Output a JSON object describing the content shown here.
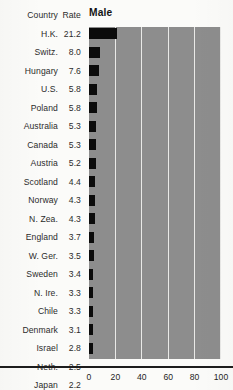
{
  "figure": {
    "title": "Male",
    "background_color": "#fbfbf9",
    "panel_color": "#8d8d8d",
    "bar_color": "#0b0b0b",
    "gridline_color": "#e9e9e7"
  },
  "table": {
    "header": {
      "country": "Country",
      "rate": "Rate",
      "series": "Male"
    }
  },
  "chart_data": {
    "type": "bar",
    "orientation": "horizontal",
    "title": "Male",
    "xlabel": "",
    "ylabel": "",
    "xlim": [
      0,
      100
    ],
    "grid": true,
    "grid_axis": "x",
    "legend": "none",
    "value_label_column_header": "Rate",
    "category_column_header": "Country",
    "xticks": [
      0,
      20,
      40,
      60,
      80,
      100
    ],
    "xticklabels": [
      "0",
      "20",
      "40",
      "60",
      "80",
      "100"
    ],
    "categories": [
      "H.K.",
      "Switz.",
      "Hungary",
      "U.S.",
      "Poland",
      "Australia",
      "Canada",
      "Austria",
      "Scotland",
      "Norway",
      "N. Zea.",
      "England",
      "W. Ger.",
      "Sweden",
      "N. Ire.",
      "Chile",
      "Denmark",
      "Israel",
      "Neth.",
      "Japan"
    ],
    "values": [
      21.2,
      8.0,
      7.6,
      5.8,
      5.8,
      5.3,
      5.3,
      5.2,
      4.4,
      4.3,
      4.3,
      3.7,
      3.5,
      3.4,
      3.3,
      3.3,
      3.1,
      2.8,
      2.5,
      2.2
    ],
    "value_labels": [
      "21.2",
      "8.0",
      "7.6",
      "5.8",
      "5.8",
      "5.3",
      "5.3",
      "5.2",
      "4.4",
      "4.3",
      "4.3",
      "3.7",
      "3.5",
      "3.4",
      "3.3",
      "3.3",
      "3.1",
      "2.8",
      "2.5",
      "2.2"
    ]
  }
}
